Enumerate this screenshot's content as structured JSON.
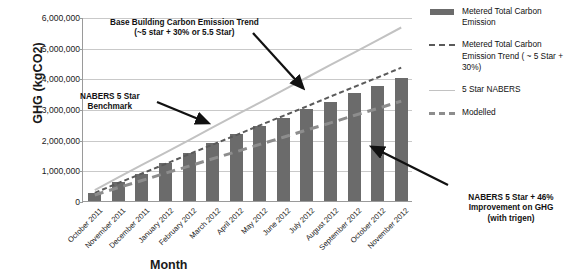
{
  "chart_data": {
    "type": "bar",
    "title": "",
    "xlabel": "Month",
    "ylabel": "GHG (kgCO2)",
    "ylim": [
      0,
      6000000
    ],
    "ytick_labels": [
      "6,000,000",
      "5,000,000",
      "4,000,000",
      "3,000,000",
      "2,000,000",
      "1,000,000",
      "0"
    ],
    "ytick_values": [
      6000000,
      5000000,
      4000000,
      3000000,
      2000000,
      1000000,
      0
    ],
    "grid": true,
    "legend_position": "right",
    "categories": [
      "October 2011",
      "November 2011",
      "December 2011",
      "January 2012",
      "February 2012",
      "March 2012",
      "April 2012",
      "May 2012",
      "June 2012",
      "July 2012",
      "August 2012",
      "September 2012",
      "October 2012",
      "November 2012"
    ],
    "series": [
      {
        "name": "Metered Total Carbon Emission",
        "type": "bar",
        "color": "#6b6b6b",
        "values": [
          250000,
          620000,
          880000,
          1250000,
          1580000,
          1900000,
          2180000,
          2450000,
          2720000,
          3000000,
          3240000,
          3520000,
          3760000,
          4000000
        ]
      },
      {
        "name": "Metered Total Carbon Emission Trend ( ~ 5 Star + 30%)",
        "type": "line",
        "style": "dashed",
        "color": "#5a5a5a",
        "values": [
          300000,
          620000,
          930000,
          1240000,
          1560000,
          1870000,
          2180000,
          2500000,
          2810000,
          3120000,
          3440000,
          3750000,
          4060000,
          4380000
        ]
      },
      {
        "name": "5 Star NABERS",
        "type": "line",
        "style": "solid",
        "color": "#c2c2c2",
        "values": [
          390000,
          800000,
          1210000,
          1610000,
          2020000,
          2430000,
          2840000,
          3240000,
          3650000,
          4060000,
          4470000,
          4870000,
          5280000,
          5690000
        ]
      },
      {
        "name": "Modelled",
        "type": "line",
        "style": "dashed",
        "color": "#8d8d8d",
        "values": [
          230000,
          470000,
          700000,
          940000,
          1170000,
          1410000,
          1640000,
          1880000,
          2110000,
          2350000,
          2580000,
          2820000,
          3050000,
          3290000
        ]
      }
    ],
    "annotations": [
      {
        "id": "base-building",
        "line1": "Base Building Carbon Emission Trend",
        "line2": "(~5 star + 30% or 5.5 Star)"
      },
      {
        "id": "nabers-benchmark",
        "line1": "NABERS 5 Star",
        "line2": "Benchmark"
      },
      {
        "id": "trigen",
        "line1": "NABERS 5 Star + 46%",
        "line2": "Improvement on GHG",
        "line3": "(with trigen)"
      }
    ]
  },
  "legend": {
    "items": [
      {
        "label": "Metered Total Carbon Emission",
        "swatch": "bar-swatch"
      },
      {
        "label": "Metered Total Carbon Emission Trend ( ~ 5 Star + 30%)",
        "swatch": "dashed-dark-line-swatch"
      },
      {
        "label": "5 Star NABERS",
        "swatch": "solid-light-line-swatch"
      },
      {
        "label": "Modelled",
        "swatch": "dashed-gray-line-swatch"
      }
    ]
  }
}
